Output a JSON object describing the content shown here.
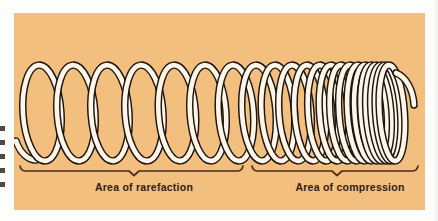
{
  "figure": {
    "type": "physics-illustration",
    "panel_color": "#f2bf7e",
    "page_color": "#fdfdfb",
    "coil_fill_color": "#fdf6e8",
    "coil_outline_color": "#1c1410",
    "brace_color": "#4a2c16",
    "caption_color": "#2e2119"
  },
  "captions": {
    "rarefaction": "Area of rarefaction",
    "compression": "Area of compression"
  },
  "braces": {
    "rarefaction": {
      "x_start": 6,
      "x_end": 229,
      "y": 158,
      "notch_x": 120
    },
    "compression": {
      "x_start": 238,
      "x_end": 404,
      "y": 158,
      "notch_x": 323
    }
  },
  "chart_data": {
    "type": "line",
    "xlabel": "",
    "ylabel": "",
    "series": [
      {
        "name": "coil-centers",
        "values": [
          28,
          62,
          96,
          130,
          163,
          194,
          222,
          245,
          264,
          281,
          296,
          309,
          320,
          330,
          339,
          347,
          354,
          360,
          365,
          370,
          374,
          378
        ]
      },
      {
        "name": "coil-half-width",
        "values": [
          19,
          19,
          19,
          19,
          18.5,
          18,
          17.5,
          17,
          16.5,
          16,
          15.5,
          15,
          14.5,
          14,
          14,
          13.5,
          13.5,
          13,
          13,
          13,
          12.5,
          12.5
        ]
      }
    ],
    "annotations": [
      "Area of rarefaction",
      "Area of compression"
    ],
    "grid": false,
    "legend": "none"
  },
  "margin_marks": {
    "count": 5,
    "spacing": 14
  }
}
